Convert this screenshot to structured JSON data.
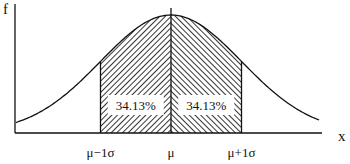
{
  "chart_data": {
    "type": "area",
    "title": "",
    "xlabel": "x",
    "ylabel": "f",
    "distribution": "normal",
    "mean": 0,
    "sd": 1,
    "xlim": [
      -3.5,
      3.5
    ],
    "shaded_regions": [
      {
        "from": -1,
        "to": 0,
        "label": "34.13%",
        "hatch": "forward"
      },
      {
        "from": 0,
        "to": 1,
        "label": "34.13%",
        "hatch": "backward"
      }
    ],
    "x_ticks": [
      {
        "value": -1,
        "label": "μ−1σ"
      },
      {
        "value": 0,
        "label": "μ"
      },
      {
        "value": 1,
        "label": "μ+1σ"
      }
    ]
  }
}
